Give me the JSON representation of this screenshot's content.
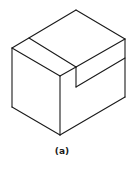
{
  "figure": {
    "type": "isometric-block-with-notch",
    "caption": "(a)",
    "line_color": "#1a1a1a"
  }
}
